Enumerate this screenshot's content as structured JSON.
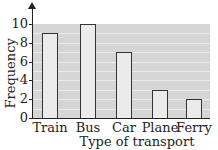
{
  "chart_data": {
    "type": "bar",
    "title": "",
    "xlabel": "Type of transport",
    "ylabel": "Frequency",
    "categories": [
      "Train",
      "Bus",
      "Car",
      "Plane",
      "Ferry"
    ],
    "values": [
      9,
      10,
      7,
      3,
      2
    ],
    "ylim": [
      0,
      10
    ],
    "yticks": [
      0,
      2,
      4,
      6,
      8,
      10
    ],
    "grid": true,
    "legend": null,
    "colors": {
      "bar_fill": "#ebebeb",
      "plot_bg": "#d6d6d6",
      "bar_edge": "#333333"
    }
  }
}
